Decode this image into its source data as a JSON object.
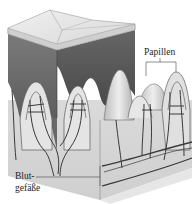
{
  "figure": {
    "colors": {
      "background": "#ffffff",
      "epidermis_top": "#e8e8e8",
      "epidermis_side": "#6e6e6e",
      "epidermis_side_dark": "#555555",
      "dermis": "#d4d4d4",
      "dermis_light": "#e2e2e2",
      "vessel": "#3a3a3a",
      "line": "#444444"
    }
  },
  "labels": {
    "papillen": "Papillen",
    "blutgefaesse_line1": "Blut-",
    "blutgefaesse_line2": "gefäße"
  }
}
